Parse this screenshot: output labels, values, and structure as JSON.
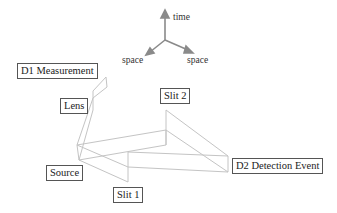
{
  "diagram": {
    "type": "spacetime-experiment-schematic",
    "axes": {
      "up": "time",
      "left": "space",
      "right": "space"
    },
    "labels": {
      "d1": "D1 Measurement",
      "lens": "Lens",
      "slit2": "Slit 2",
      "source": "Source",
      "slit1": "Slit 1",
      "d2": "D2 Detection Event"
    },
    "colors": {
      "lines": "#c4c4c4",
      "axes": "#8a8a8a",
      "label_border": "#555555",
      "text": "#222222"
    }
  }
}
